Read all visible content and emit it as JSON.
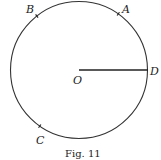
{
  "figure": {
    "caption": "Fig. 11",
    "center_label": "O",
    "points": [
      {
        "label": "A",
        "angle_deg": 55
      },
      {
        "label": "B",
        "angle_deg": 128
      },
      {
        "label": "C",
        "angle_deg": 235
      },
      {
        "label": "D",
        "angle_deg": 0
      }
    ],
    "radius_segment": {
      "from": "O",
      "to": "D"
    },
    "stroke_color": "#333333"
  }
}
